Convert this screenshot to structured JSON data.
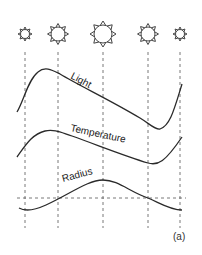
{
  "diagram": {
    "type": "cepheid-pulsation-cycle",
    "stars": [
      {
        "phase": 1,
        "cx": 25,
        "cy": 34,
        "r": 4.5,
        "ray": 2.5
      },
      {
        "phase": 2,
        "cx": 58,
        "cy": 34,
        "r": 7,
        "ray": 3.5
      },
      {
        "phase": 3,
        "cx": 103,
        "cy": 34,
        "r": 9,
        "ray": 4
      },
      {
        "phase": 4,
        "cx": 148,
        "cy": 34,
        "r": 7,
        "ray": 3.5
      },
      {
        "phase": 5,
        "cx": 180,
        "cy": 34,
        "r": 4.5,
        "ray": 2.5
      }
    ],
    "guide_x": [
      25,
      58,
      103,
      148,
      180
    ],
    "curves": [
      {
        "name": "light",
        "label": "Light"
      },
      {
        "name": "temperature",
        "label": "Temperature"
      },
      {
        "name": "radius",
        "label": "Radius"
      }
    ],
    "panel_label": "(a)"
  }
}
